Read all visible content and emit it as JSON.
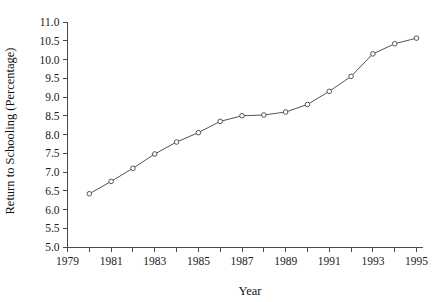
{
  "chart_data": {
    "type": "line",
    "title": "",
    "subtitle": "",
    "xlabel": "Year",
    "ylabel": "Return to Schooling (Percentage)",
    "xlim": [
      1979,
      1995
    ],
    "ylim": [
      5.0,
      11.0
    ],
    "grid": false,
    "legend": null,
    "legend_position": "none",
    "x_tick_labels": [
      "1979",
      "1981",
      "1983",
      "1985",
      "1987",
      "1989",
      "1991",
      "1993",
      "1995"
    ],
    "x_tick_values": [
      1979,
      1981,
      1983,
      1985,
      1987,
      1989,
      1991,
      1993,
      1995
    ],
    "x_minor_tick_values": [
      1980,
      1982,
      1984,
      1986,
      1988,
      1990,
      1992,
      1994
    ],
    "y_tick_labels": [
      "5.0",
      "5.5",
      "6.0",
      "6.5",
      "7.0",
      "7.5",
      "8.0",
      "8.5",
      "9.0",
      "9.5",
      "10.0",
      "10.5",
      "11.0"
    ],
    "y_tick_values": [
      5.0,
      5.5,
      6.0,
      6.5,
      7.0,
      7.5,
      8.0,
      8.5,
      9.0,
      9.5,
      10.0,
      10.5,
      11.0
    ],
    "x": [
      1980,
      1981,
      1982,
      1983,
      1984,
      1985,
      1986,
      1987,
      1988,
      1989,
      1990,
      1991,
      1992,
      1993,
      1994,
      1995
    ],
    "series": [
      {
        "name": "Return to Schooling",
        "color": "#555555",
        "marker": "open-circle",
        "values": [
          6.42,
          6.75,
          7.1,
          7.48,
          7.8,
          8.05,
          8.35,
          8.5,
          8.52,
          8.6,
          8.8,
          9.15,
          9.55,
          10.15,
          10.42,
          10.57
        ]
      }
    ],
    "colors": {
      "line": "#555555",
      "marker_fill": "#ffffff",
      "marker_stroke": "#555555",
      "axis": "#4a4a4a",
      "text": "#1a1a1a",
      "background": "#ffffff"
    }
  }
}
